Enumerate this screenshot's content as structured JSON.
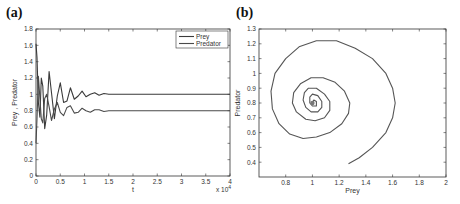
{
  "panels": {
    "a": {
      "label": "(a)"
    },
    "b": {
      "label": "(b)"
    }
  },
  "chart_data": [
    {
      "id": "a",
      "type": "line",
      "title": "",
      "panel_label": "(a)",
      "xlabel": "t",
      "ylabel": "Prey , Predator",
      "x_multiplier": "x 10^4",
      "xlim": [
        0,
        4
      ],
      "ylim": [
        0,
        1.8
      ],
      "xticks": [
        0,
        0.5,
        1,
        1.5,
        2,
        2.5,
        3,
        3.5,
        4
      ],
      "xtick_labels": [
        "0",
        "0.5",
        "1",
        "1.5",
        "2",
        "2.5",
        "3",
        "3.5",
        "4"
      ],
      "yticks": [
        0,
        0.2,
        0.4,
        0.6,
        0.8,
        1,
        1.2,
        1.4,
        1.6,
        1.8
      ],
      "ytick_labels": [
        "0",
        "0.2",
        "0.4",
        "0.6",
        "0.8",
        "1",
        "1.2",
        "1.4",
        "1.6",
        "1.8"
      ],
      "grid": false,
      "legend": {
        "position": "upper right",
        "entries": [
          "Prey",
          "Predator"
        ]
      },
      "series": [
        {
          "name": "Prey",
          "equilibrium": 1.0,
          "x": [
            0,
            0.02,
            0.05,
            0.08,
            0.11,
            0.14,
            0.18,
            0.22,
            0.27,
            0.32,
            0.38,
            0.44,
            0.5,
            0.57,
            0.64,
            0.71,
            0.79,
            0.87,
            0.95,
            1.03,
            1.12,
            1.21,
            1.3,
            1.4,
            1.5,
            1.65,
            1.8,
            2.0,
            2.5,
            3.0,
            3.5,
            4.0
          ],
          "values": [
            1.62,
            1.45,
            0.9,
            0.72,
            1.2,
            1.1,
            0.58,
            0.75,
            1.28,
            1.02,
            0.7,
            0.98,
            1.14,
            0.9,
            0.92,
            1.08,
            0.94,
            0.98,
            1.04,
            0.97,
            1.0,
            1.02,
            0.99,
            1.01,
            1.0,
            1.0,
            1.0,
            1.0,
            1.0,
            1.0,
            1.0,
            1.0
          ]
        },
        {
          "name": "Predator",
          "equilibrium": 0.8,
          "x": [
            0,
            0.02,
            0.05,
            0.08,
            0.11,
            0.14,
            0.18,
            0.22,
            0.27,
            0.32,
            0.38,
            0.44,
            0.5,
            0.57,
            0.64,
            0.71,
            0.79,
            0.87,
            0.95,
            1.03,
            1.12,
            1.21,
            1.3,
            1.4,
            1.5,
            1.65,
            1.8,
            2.0,
            2.5,
            3.0,
            3.5,
            4.0
          ],
          "values": [
            0.4,
            0.7,
            1.22,
            0.95,
            0.7,
            0.65,
            0.95,
            1.0,
            0.85,
            0.68,
            0.82,
            0.9,
            0.78,
            0.74,
            0.84,
            0.86,
            0.77,
            0.78,
            0.83,
            0.8,
            0.78,
            0.81,
            0.81,
            0.79,
            0.8,
            0.8,
            0.8,
            0.8,
            0.8,
            0.8,
            0.8,
            0.8
          ]
        }
      ]
    },
    {
      "id": "b",
      "type": "line",
      "title": "",
      "panel_label": "(b)",
      "xlabel": "Prey",
      "ylabel": "Predator",
      "xlim": [
        0.6,
        2
      ],
      "ylim": [
        0.3,
        1.3
      ],
      "xticks": [
        0.8,
        1,
        1.2,
        1.4,
        1.6,
        1.8,
        2
      ],
      "xtick_labels": [
        "0.8",
        "1",
        "1.2",
        "1.4",
        "1.6",
        "1.8",
        "2"
      ],
      "yticks": [
        0.4,
        0.5,
        0.6,
        0.7,
        0.8,
        0.9,
        1,
        1.1,
        1.2,
        1.3
      ],
      "ytick_labels": [
        "0.4",
        "0.5",
        "0.6",
        "0.7",
        "0.8",
        "0.9",
        "1",
        "1.1",
        "1.2",
        "1.3"
      ],
      "grid": false,
      "series": [
        {
          "name": "Phase trajectory (Prey vs Predator)",
          "start": [
            1.27,
            0.39
          ],
          "equilibrium": [
            1.0,
            0.8
          ],
          "x": [
            1.27,
            1.35,
            1.45,
            1.55,
            1.6,
            1.62,
            1.6,
            1.55,
            1.45,
            1.32,
            1.18,
            1.03,
            0.9,
            0.8,
            0.72,
            0.69,
            0.7,
            0.75,
            0.83,
            0.93,
            1.03,
            1.13,
            1.22,
            1.27,
            1.28,
            1.24,
            1.17,
            1.08,
            0.99,
            0.91,
            0.86,
            0.85,
            0.88,
            0.95,
            1.02,
            1.09,
            1.13,
            1.13,
            1.09,
            1.03,
            0.97,
            0.94,
            0.93,
            0.95,
            0.99,
            1.04,
            1.07,
            1.07,
            1.04,
            1.0,
            0.98,
            0.98,
            1.0,
            1.03,
            1.03,
            1.01,
            1.0
          ],
          "values": [
            0.39,
            0.43,
            0.5,
            0.6,
            0.7,
            0.8,
            0.9,
            1.0,
            1.1,
            1.17,
            1.22,
            1.22,
            1.18,
            1.1,
            1.0,
            0.88,
            0.76,
            0.66,
            0.59,
            0.56,
            0.57,
            0.6,
            0.66,
            0.73,
            0.8,
            0.88,
            0.94,
            0.97,
            0.97,
            0.93,
            0.87,
            0.8,
            0.74,
            0.69,
            0.68,
            0.7,
            0.75,
            0.81,
            0.86,
            0.9,
            0.9,
            0.87,
            0.82,
            0.77,
            0.74,
            0.74,
            0.77,
            0.81,
            0.85,
            0.86,
            0.84,
            0.8,
            0.78,
            0.78,
            0.81,
            0.82,
            0.8
          ]
        }
      ]
    }
  ]
}
